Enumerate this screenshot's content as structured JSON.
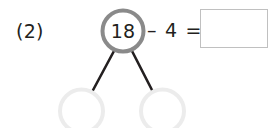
{
  "problem": {
    "number_label": "(2)",
    "type": "number-bond-subtraction"
  },
  "number_bond": {
    "total": {
      "value": "18",
      "circle_stroke_color": "#8a8a8a",
      "text_color": "#231f20"
    },
    "parts": [
      {
        "value": "",
        "circle_stroke_color": "#ececec"
      },
      {
        "value": "",
        "circle_stroke_color": "#ececec"
      }
    ],
    "connector_color": "#231f20"
  },
  "equation": {
    "operator_text": "– 4 =",
    "minuend": "18",
    "subtrahend": "4",
    "answer_value": "",
    "answer_box_border_color": "#c0c0c0"
  },
  "canvas": {
    "background_color": "#ffffff",
    "width": 275,
    "height": 128
  }
}
